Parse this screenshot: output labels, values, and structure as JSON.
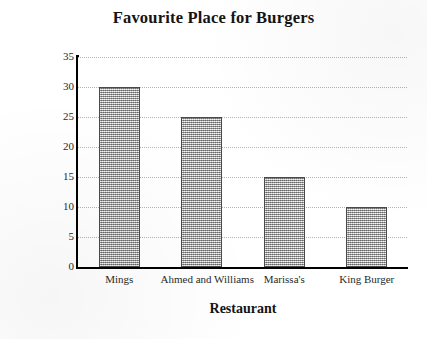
{
  "chart_data": {
    "type": "bar",
    "title": "Favourite Place for Burgers",
    "xlabel": "Restaurant",
    "ylabel": "Number of students",
    "categories": [
      "Mings",
      "Ahmed and Williams",
      "Marissa's",
      "King Burger"
    ],
    "values": [
      30,
      25,
      15,
      10
    ],
    "ylim": [
      0,
      35
    ],
    "ytick_labels": [
      "0",
      "5",
      "10",
      "15",
      "20",
      "25",
      "30",
      "35"
    ],
    "ytick_values": [
      0,
      5,
      10,
      15,
      20,
      25,
      30,
      35
    ],
    "ytick_step": 5,
    "grid": true,
    "grid_axis": "y",
    "grid_style": "dotted",
    "legend": false,
    "legend_position": "none",
    "bar_fill": "#a6a6a6",
    "bar_pattern": "dithered-gray",
    "bar_edge_color": "#4a4a4a",
    "axis_color": "#000000",
    "grid_color": "#9a9a9a",
    "background_color": "#ffffff",
    "text_color": "#141414"
  }
}
